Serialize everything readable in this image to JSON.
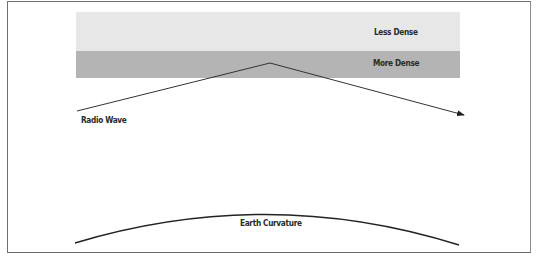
{
  "diagram": {
    "layers": [
      {
        "label": "Less Dense",
        "color": "#e7e7e7"
      },
      {
        "label": "More Dense",
        "color": "#b4b4b4"
      }
    ],
    "wave": {
      "label": "Radio Wave",
      "color": "#333333"
    },
    "ground": {
      "label": "Earth Curvature",
      "color": "#222222"
    },
    "frame_color": "#707070"
  }
}
